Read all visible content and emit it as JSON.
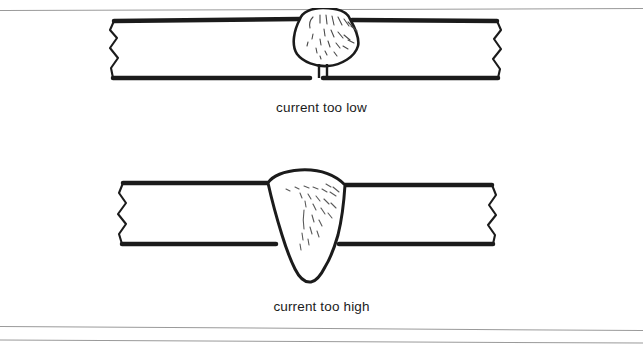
{
  "page": {
    "background_color": "#ffffff",
    "ink_color": "#1b1b1b",
    "rule_color": "#9a9a9a"
  },
  "rules": [
    {
      "name": "top-rule"
    },
    {
      "name": "bottom-rule-upper"
    },
    {
      "name": "bottom-rule-lower"
    }
  ],
  "figures": [
    {
      "id": "current-too-low",
      "caption": "current too low",
      "description": "Cross-section of a welded butt joint where the weld bead sits high and rounded on top of the plate with only a narrow stub of penetration through the joint.",
      "weld_profile": "excess convex crown, minimal penetration"
    },
    {
      "id": "current-too-high",
      "caption": "current too high",
      "description": "Cross-section of a welded butt joint where the weld metal has burned through, tapering down through the plate and drooping below the underside.",
      "weld_profile": "full burn-through with drop-through on root side"
    }
  ],
  "captions": {
    "low": "current too low",
    "high": "current too high"
  }
}
